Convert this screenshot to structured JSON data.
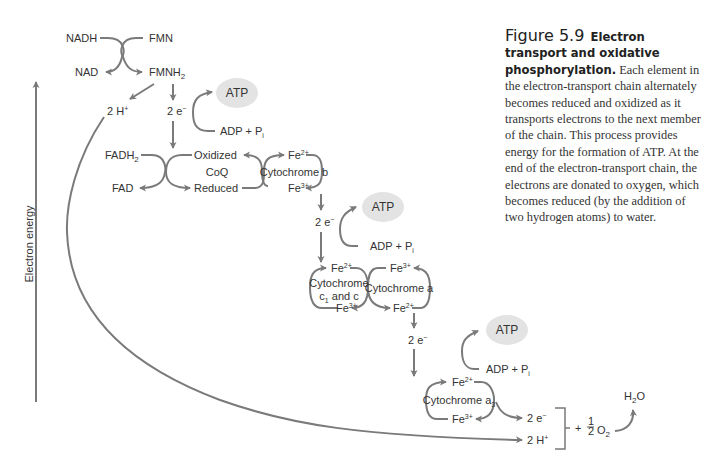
{
  "figure": {
    "number": "Figure 5.9",
    "title": "Electron transport and oxidative phosphorylation.",
    "caption_body": "Each element in the electron-transport chain alternately becomes reduced and oxidized as it transports electrons to the next member of the chain. This process provides energy for the formation of ATP. At the end of the electron-transport chain, the electrons are donated to oxygen, which becomes reduced (by the addition of two hydrogen atoms) to water."
  },
  "axis": {
    "label": "Electron energy"
  },
  "colors": {
    "line": "#7a7a7a",
    "text": "#333333",
    "atp_fill": "#e3e3e3"
  },
  "nodes": {
    "nadh": "NADH",
    "fmn": "FMN",
    "nad": "NAD",
    "fmnh2_base": "FMNH",
    "fmnh2_sub": "2",
    "two_h_top_base": "2 H",
    "two_h_top_sup": "+",
    "e1_base": "2 e",
    "e1_sup": "−",
    "atp1": "ATP",
    "adp1_base": "ADP + P",
    "adp1_sub": "i",
    "fadh2_base": "FADH",
    "fadh2_sub": "2",
    "fad": "FAD",
    "coq_oxidized": "Oxidized",
    "coq": "CoQ",
    "coq_reduced": "Reduced",
    "cytb_fe2_base": "Fe",
    "cytb_fe2_sup": "2+",
    "cytb": "Cytochrome b",
    "cytb_fe3_base": "Fe",
    "cytb_fe3_sup": "3+",
    "e2_base": "2 e",
    "e2_sup": "−",
    "atp2": "ATP",
    "adp2_base": "ADP + P",
    "adp2_sub": "i",
    "cytc_fe2_base": "Fe",
    "cytc_fe2_sup": "2+",
    "cytc_line1": "Cytochrome",
    "cytc_line2_a": "c",
    "cytc_line2_sub": "1",
    "cytc_line2_b": " and c",
    "cytc_fe3_base": "Fe",
    "cytc_fe3_sup": "3+",
    "cyta_fe3_base": "Fe",
    "cyta_fe3_sup": "3+",
    "cyta": "Cytochrome a",
    "cyta_fe2_base": "Fe",
    "cyta_fe2_sup": "2+",
    "e3_base": "2 e",
    "e3_sup": "−",
    "atp3": "ATP",
    "adp3_base": "ADP + P",
    "adp3_sub": "i",
    "cyta3_fe2_base": "Fe",
    "cyta3_fe2_sup": "2+",
    "cyta3_base": "Cytochrome a",
    "cyta3_sub": "3",
    "cyta3_fe3_base": "Fe",
    "cyta3_fe3_sup": "3+",
    "e_final_base": "2 e",
    "e_final_sup": "−",
    "h_final_base": "2 H",
    "h_final_sup": "+",
    "plus": "+",
    "half_num": "1",
    "half_den": "2",
    "o2_base": "O",
    "o2_sub": "2",
    "h2o_a": "H",
    "h2o_sub": "2",
    "h2o_b": "O"
  }
}
